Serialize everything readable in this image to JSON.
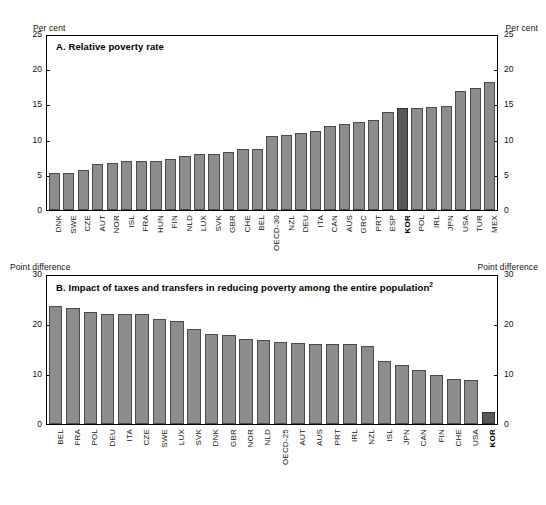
{
  "figure": {
    "unit_label_a": "Per cent",
    "unit_label_b": "Point difference"
  },
  "chart_data": [
    {
      "type": "bar",
      "panel": "A",
      "title": "A. Relative poverty rate",
      "ylabel": "Per cent",
      "xlabel": "",
      "ylim": [
        0,
        25
      ],
      "yticks": [
        0,
        5,
        10,
        15,
        20,
        25
      ],
      "grid": false,
      "legend": "none",
      "highlight": "KOR",
      "highlight_color": "#585858",
      "bar_color": "#8d8d8d",
      "categories": [
        "DNK",
        "SWE",
        "CZE",
        "AUT",
        "NOR",
        "ISL",
        "FRA",
        "HUN",
        "FIN",
        "NLD",
        "LUX",
        "SVK",
        "GBR",
        "CHE",
        "BEL",
        "OECD-30",
        "NZL",
        "DEU",
        "ITA",
        "CAN",
        "AUS",
        "GRC",
        "PRT",
        "ESP",
        "KOR",
        "POL",
        "IRL",
        "JPN",
        "USA",
        "TUR",
        "MEX"
      ],
      "values": [
        5.3,
        5.3,
        5.8,
        6.6,
        6.8,
        7.1,
        7.1,
        7.1,
        7.3,
        7.7,
        8.1,
        8.1,
        8.3,
        8.7,
        8.8,
        10.6,
        10.8,
        11.0,
        11.4,
        12.0,
        12.4,
        12.6,
        12.9,
        14.1,
        14.6,
        14.6,
        14.8,
        14.9,
        17.1,
        17.5,
        18.4
      ]
    },
    {
      "type": "bar",
      "panel": "B",
      "title": "B. Impact of taxes and transfers in reducing poverty among the entire population",
      "title_footnote": "2",
      "ylabel": "Point difference",
      "xlabel": "",
      "ylim": [
        0,
        30
      ],
      "yticks": [
        0,
        10,
        20,
        30
      ],
      "grid": false,
      "legend": "none",
      "highlight": "KOR",
      "highlight_color": "#585858",
      "bar_color": "#8d8d8d",
      "categories": [
        "BEL",
        "FRA",
        "POL",
        "DEU",
        "ITA",
        "CZE",
        "SWE",
        "LUX",
        "SVK",
        "DNK",
        "GBR",
        "NOR",
        "NLD",
        "OECD-25",
        "AUT",
        "AUS",
        "PRT",
        "IRL",
        "NZL",
        "ISL",
        "JPN",
        "CAN",
        "FIN",
        "CHE",
        "USA",
        "KOR"
      ],
      "values": [
        23.9,
        23.5,
        22.8,
        22.3,
        22.2,
        22.2,
        21.3,
        20.9,
        19.2,
        18.2,
        18.0,
        17.2,
        17.0,
        16.6,
        16.4,
        16.3,
        16.3,
        16.2,
        15.9,
        12.8,
        11.9,
        10.9,
        9.9,
        9.2,
        9.0,
        2.5
      ]
    }
  ],
  "panelA": {
    "title": "A. Relative poverty rate",
    "unit_left": "Per cent",
    "unit_right": "Per cent",
    "yticks": [
      "25",
      "20",
      "15",
      "10",
      "5",
      "0"
    ]
  },
  "panelB": {
    "title_text": "B. Impact of taxes and transfers in reducing poverty among the entire population",
    "title_sup": "2",
    "unit_left": "Point difference",
    "unit_right": "Point difference",
    "yticks": [
      "30",
      "20",
      "10",
      "0"
    ]
  }
}
